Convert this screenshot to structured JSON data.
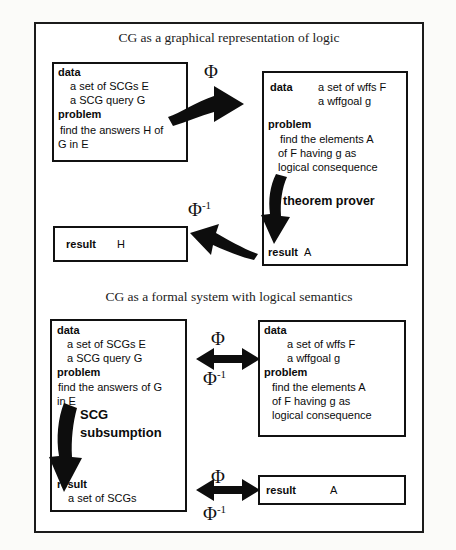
{
  "figure": {
    "kind": "diagram",
    "sections": [
      {
        "title": "CG as a graphical representation of logic",
        "boxes": [
          {
            "id": "top-left-data",
            "lines": [
              {
                "label": "data",
                "bold": true
              },
              {
                "text": "a set of SCGs E"
              },
              {
                "text": "a SCG query  G"
              },
              {
                "label": "problem",
                "bold": true
              },
              {
                "text": "find the answers H of"
              },
              {
                "text": "G in E"
              }
            ]
          },
          {
            "id": "top-right-data",
            "lines": [
              {
                "label": "data",
                "bold": true
              },
              {
                "text": "a set of wffs F"
              },
              {
                "text": "a wffgoal g"
              },
              {
                "label": "problem",
                "bold": true
              },
              {
                "text": "find the elements A"
              },
              {
                "text": "of F having g as"
              },
              {
                "text": "logical consequence"
              }
            ],
            "inline_process": "theorem prover",
            "result_label": "result",
            "result_value": "A"
          },
          {
            "id": "top-left-result",
            "result_label": "result",
            "result_value": "H"
          }
        ],
        "arrows": [
          {
            "id": "phi-forward",
            "label": "Φ",
            "direction": "right"
          },
          {
            "id": "phi-inverse-back",
            "label": "Φ⁻¹",
            "direction": "left"
          },
          {
            "id": "theorem-prover-down",
            "label": "theorem prover",
            "direction": "down"
          }
        ]
      },
      {
        "title": "CG as a formal system with logical semantics",
        "boxes": [
          {
            "id": "bottom-left-data",
            "lines": [
              {
                "label": "data",
                "bold": true
              },
              {
                "text": "a set of SCGs E"
              },
              {
                "text": "a SCG query  G"
              },
              {
                "label": "problem",
                "bold": true
              },
              {
                "text": "find the answers of G"
              },
              {
                "text": "in E"
              }
            ],
            "inline_process_line1": "SCG",
            "inline_process_line2": "subsumption",
            "result_label": "result",
            "result_value": "a set of SCGs"
          },
          {
            "id": "bottom-right-data",
            "lines": [
              {
                "label": "data",
                "bold": true
              },
              {
                "text": "a set of wffs F"
              },
              {
                "text": "a wffgoal g"
              },
              {
                "label": "problem",
                "bold": true
              },
              {
                "text": "find the elements A"
              },
              {
                "text": "of F having g as"
              },
              {
                "text": "logical consequence"
              }
            ]
          },
          {
            "id": "bottom-right-result",
            "result_label": "result",
            "result_value": "A"
          }
        ],
        "arrows": [
          {
            "id": "phi-bidir-data",
            "top_label": "Φ",
            "bottom_label": "Φ⁻¹",
            "direction": "both"
          },
          {
            "id": "phi-bidir-result",
            "top_label": "Φ",
            "bottom_label": "Φ⁻¹",
            "direction": "both"
          },
          {
            "id": "scg-subsumption-down",
            "label": "SCG subsumption",
            "direction": "down"
          }
        ]
      }
    ],
    "colors": {
      "ink": "#0d0d0d",
      "border": "#111111",
      "background": "#ffffff"
    }
  },
  "labels": {
    "phi": "Φ",
    "phi_inverse_base": "Φ",
    "phi_inverse_exp": "-1",
    "data": "data",
    "problem": "problem",
    "result": "result",
    "theorem_prover": "theorem prover",
    "scg": "SCG",
    "subsumption": "subsumption"
  }
}
